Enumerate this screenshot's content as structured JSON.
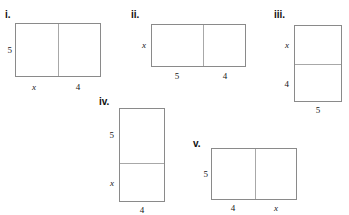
{
  "worksheet": {
    "description": "Five labeled rectangle area-model diagrams partitioned into two regions",
    "figures": [
      {
        "numeral": "i.",
        "orientation": "horizontal",
        "side_label": "5",
        "segment_labels": [
          "x",
          "4"
        ]
      },
      {
        "numeral": "ii.",
        "orientation": "horizontal",
        "side_label": "x",
        "segment_labels": [
          "5",
          "4"
        ]
      },
      {
        "numeral": "iii.",
        "orientation": "vertical",
        "side_labels": [
          "x",
          "4"
        ],
        "bottom_label": "5"
      },
      {
        "numeral": "iv.",
        "orientation": "vertical",
        "side_labels": [
          "5",
          "x"
        ],
        "bottom_label": "4"
      },
      {
        "numeral": "v.",
        "orientation": "horizontal",
        "side_label": "5",
        "segment_labels": [
          "4",
          "x"
        ]
      }
    ]
  },
  "colors": {
    "outline": "#8a8a8a",
    "divider": "#a8a8a8",
    "text": "#161616",
    "background": "#ffffff"
  }
}
